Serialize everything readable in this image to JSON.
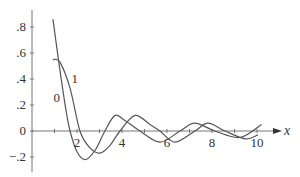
{
  "chart_data": {
    "type": "line",
    "title": "",
    "xlabel": "x",
    "ylabel": "",
    "xlim": [
      0,
      10.5
    ],
    "ylim": [
      -0.25,
      0.9
    ],
    "grid": false,
    "legend": "inline curve labels",
    "x_ticks": [
      {
        "value": 2,
        "label": "2"
      },
      {
        "value": 4,
        "label": "4"
      },
      {
        "value": 6,
        "label": "6"
      },
      {
        "value": 8,
        "label": "8"
      },
      {
        "value": 10,
        "label": "10"
      }
    ],
    "y_ticks": [
      {
        "value": 0.8,
        "label": ".8"
      },
      {
        "value": 0.6,
        "label": ".6"
      },
      {
        "value": 0.4,
        "label": ".4"
      },
      {
        "value": 0.2,
        "label": ".2"
      },
      {
        "value": 0,
        "label": "0"
      },
      {
        "value": -0.2,
        "label": "-.2"
      }
    ],
    "series": [
      {
        "name": "0",
        "label_pos": [
          1.1,
          0.22
        ],
        "x": [
          0.93,
          1.24,
          1.51,
          1.69,
          2.0,
          2.36,
          2.8,
          3.24,
          3.69,
          4.13,
          4.8,
          5.69,
          6.58,
          7.24,
          8.13,
          9.24,
          10.2
        ],
        "y": [
          0.86,
          0.47,
          0.16,
          0.0,
          -0.16,
          -0.22,
          -0.15,
          0.0,
          0.12,
          0.08,
          0.0,
          -0.085,
          0.0,
          0.06,
          0.0,
          -0.05,
          0.05
        ]
      },
      {
        "name": "1",
        "label_pos": [
          1.9,
          0.37
        ],
        "x": [
          0.93,
          1.24,
          1.69,
          2.13,
          2.58,
          3.02,
          3.47,
          3.91,
          4.58,
          5.24,
          5.69,
          6.36,
          7.24,
          7.82,
          8.58,
          9.47,
          10.04
        ],
        "y": [
          0.55,
          0.53,
          0.33,
          0.0,
          -0.13,
          -0.17,
          -0.11,
          0.0,
          0.12,
          0.05,
          0.0,
          -0.085,
          0.0,
          0.06,
          0.0,
          -0.06,
          -0.03
        ]
      }
    ]
  },
  "colors": {
    "curve": "#555555",
    "axis": "#777777",
    "text": "#333333"
  }
}
